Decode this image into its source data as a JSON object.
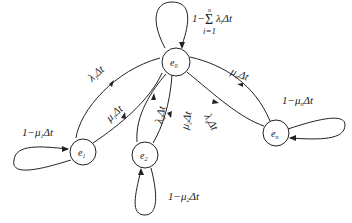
{
  "diagram": {
    "type": "state-transition",
    "nodes": [
      {
        "id": "e0",
        "label": "e",
        "sub": "0",
        "x": 176,
        "y": 62
      },
      {
        "id": "e1",
        "label": "e",
        "sub": "1",
        "x": 83,
        "y": 152
      },
      {
        "id": "e2",
        "label": "e",
        "sub": "2",
        "x": 145,
        "y": 155
      },
      {
        "id": "en",
        "label": "e",
        "sub": "n",
        "x": 276,
        "y": 133
      }
    ],
    "labels": {
      "self_e0": "1−Σ λᵢΔt",
      "self_e0_sum_top": "n",
      "self_e0_sum_bottom": "i=1",
      "self_e0_main": "1−",
      "self_e0_tail": "λ",
      "self_e0_tail_sub": "i",
      "self_e0_dt": "Δt",
      "self_e1": "1−μ",
      "self_e1_sub": "1",
      "self_e1_dt": "Δt",
      "self_e2": "1−μ",
      "self_e2_sub": "2",
      "self_e2_dt": "Δt",
      "self_en": "1−μ",
      "self_en_sub": "n",
      "self_en_dt": "Δt",
      "e0_to_e1": "λ",
      "e0_to_e1_sub": "1",
      "e1_to_e0": "μ",
      "e1_to_e0_sub": "1",
      "e0_to_e2": "λ",
      "e0_to_e2_sub": "2",
      "e2_to_e0": "μ",
      "e2_to_e0_sub": "2",
      "e0_to_en": "λ",
      "e0_to_en_sub": "n",
      "en_to_e0": "μ",
      "en_to_e0_sub": "n",
      "dt": "Δt"
    },
    "edges": [
      {
        "from": "e0",
        "to": "e0",
        "label": "1−Σ(i=1..n) λᵢΔt"
      },
      {
        "from": "e0",
        "to": "e1",
        "label": "λ₁Δt"
      },
      {
        "from": "e1",
        "to": "e0",
        "label": "μ₁Δt"
      },
      {
        "from": "e1",
        "to": "e1",
        "label": "1−μ₁Δt"
      },
      {
        "from": "e0",
        "to": "e2",
        "label": "λ₂Δt"
      },
      {
        "from": "e2",
        "to": "e0",
        "label": "μ₂Δt"
      },
      {
        "from": "e2",
        "to": "e2",
        "label": "1−μ₂Δt"
      },
      {
        "from": "e0",
        "to": "en",
        "label": "λₙΔt"
      },
      {
        "from": "en",
        "to": "e0",
        "label": "μₙΔt"
      },
      {
        "from": "en",
        "to": "en",
        "label": "1−μₙΔt"
      }
    ],
    "colors": {
      "stroke": "#222222",
      "background": "#ffffff"
    }
  }
}
